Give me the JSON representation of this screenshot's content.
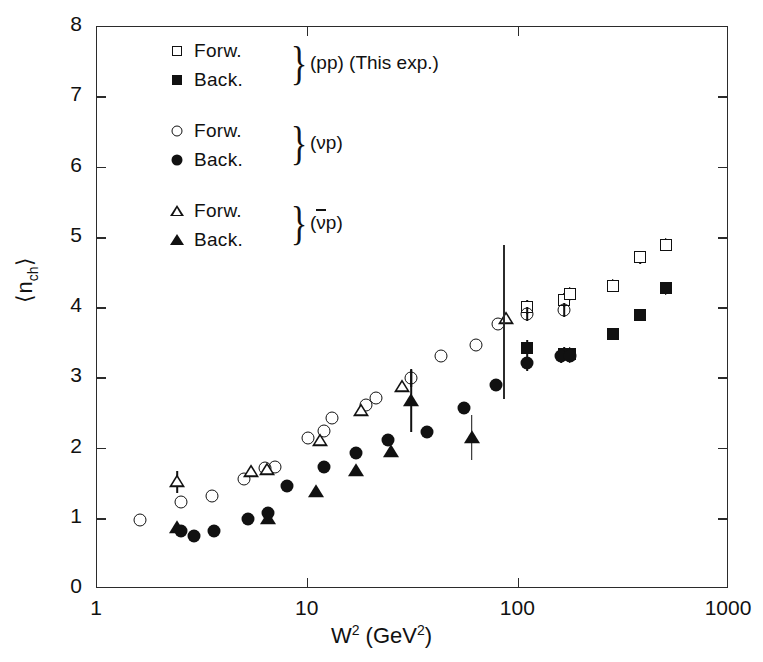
{
  "figure": {
    "background": "#ffffff",
    "ink_color": "#111111"
  },
  "axes": {
    "x": {
      "label_text": "W",
      "label_sup": "2",
      "label_unit": "(GeV",
      "label_unit_sup": "2",
      "label_unit_close": ")",
      "label_full": "W2 (GeV2)",
      "scale": "log",
      "min": 1,
      "max": 1000,
      "ticks": [
        {
          "value": 1,
          "label": "1"
        },
        {
          "value": 10,
          "label": "10"
        },
        {
          "value": 100,
          "label": "100"
        },
        {
          "value": 1000,
          "label": "1000"
        }
      ]
    },
    "y": {
      "label_prefix": "⟨n",
      "label_sub": "ch",
      "label_suffix": "⟩",
      "label_full": "⟨n_ch⟩",
      "scale": "linear",
      "min": 0,
      "max": 8,
      "ticks": [
        {
          "value": 0,
          "label": "0"
        },
        {
          "value": 1,
          "label": "1"
        },
        {
          "value": 2,
          "label": "2"
        },
        {
          "value": 3,
          "label": "3"
        },
        {
          "value": 4,
          "label": "4"
        },
        {
          "value": 5,
          "label": "5"
        },
        {
          "value": 6,
          "label": "6"
        },
        {
          "value": 7,
          "label": "7"
        },
        {
          "value": 8,
          "label": "8"
        }
      ]
    }
  },
  "legend": {
    "groups": [
      {
        "tag": "(pp) (This exp.)",
        "rows": [
          {
            "marker": "open-square",
            "label": "Forw."
          },
          {
            "marker": "filled-square",
            "label": "Back."
          }
        ]
      },
      {
        "tag": "(νp)",
        "rows": [
          {
            "marker": "open-circle",
            "label": "Forw."
          },
          {
            "marker": "filled-circle",
            "label": "Back."
          }
        ]
      },
      {
        "tag": "(νp)",
        "tag_overline": true,
        "rows": [
          {
            "marker": "open-triangle",
            "label": "Forw."
          },
          {
            "marker": "filled-triangle",
            "label": "Back."
          }
        ]
      }
    ],
    "brace_glyph": "}"
  },
  "annotations": {
    "divider_line": {
      "x_value": 85,
      "y_from": 2.7,
      "y_to": 4.9
    }
  },
  "chart_data": {
    "type": "scatter",
    "title": "",
    "xlabel": "W² (GeV²)",
    "ylabel": "⟨n_ch⟩",
    "xscale": "log",
    "xlim": [
      1,
      1000
    ],
    "ylim": [
      0,
      8
    ],
    "grid": false,
    "legend_position": "top-left inside",
    "series": [
      {
        "name": "pp Forw. (This exp.)",
        "marker": "open-square",
        "points": [
          {
            "x": 110,
            "y": 4.02,
            "yerr": 0.1
          },
          {
            "x": 165,
            "y": 4.12,
            "yerr": 0.1
          },
          {
            "x": 175,
            "y": 4.2,
            "yerr": 0.1
          },
          {
            "x": 280,
            "y": 4.32,
            "yerr": 0.09
          },
          {
            "x": 380,
            "y": 4.72,
            "yerr": 0.09
          },
          {
            "x": 500,
            "y": 4.9,
            "yerr": 0.09
          }
        ]
      },
      {
        "name": "pp Back. (This exp.)",
        "marker": "filled-square",
        "points": [
          {
            "x": 110,
            "y": 3.43,
            "yerr": 0.12
          },
          {
            "x": 165,
            "y": 3.35,
            "yerr": 0.1
          },
          {
            "x": 175,
            "y": 3.35,
            "yerr": 0.1
          },
          {
            "x": 280,
            "y": 3.63,
            "yerr": 0.09
          },
          {
            "x": 380,
            "y": 3.9,
            "yerr": 0.09
          },
          {
            "x": 500,
            "y": 4.28,
            "yerr": 0.09
          }
        ]
      },
      {
        "name": "νp Forw.",
        "marker": "open-circle",
        "points": [
          {
            "x": 1.6,
            "y": 0.98,
            "yerr": 0
          },
          {
            "x": 2.5,
            "y": 1.24,
            "yerr": 0
          },
          {
            "x": 3.5,
            "y": 1.33,
            "yerr": 0
          },
          {
            "x": 5.0,
            "y": 1.57,
            "yerr": 0
          },
          {
            "x": 6.3,
            "y": 1.72,
            "yerr": 0
          },
          {
            "x": 7.0,
            "y": 1.73,
            "yerr": 0
          },
          {
            "x": 10.0,
            "y": 2.15,
            "yerr": 0
          },
          {
            "x": 12.0,
            "y": 2.25,
            "yerr": 0
          },
          {
            "x": 13.0,
            "y": 2.43,
            "yerr": 0
          },
          {
            "x": 19.0,
            "y": 2.62,
            "yerr": 0
          },
          {
            "x": 21.0,
            "y": 2.72,
            "yerr": 0
          },
          {
            "x": 31.0,
            "y": 3.0,
            "yerr": 0.12
          },
          {
            "x": 43.0,
            "y": 3.32,
            "yerr": 0
          },
          {
            "x": 63.0,
            "y": 3.47,
            "yerr": 0
          },
          {
            "x": 80.0,
            "y": 3.77,
            "yerr": 0
          },
          {
            "x": 110.0,
            "y": 3.92,
            "yerr": 0.1
          },
          {
            "x": 165.0,
            "y": 3.97,
            "yerr": 0.1
          }
        ]
      },
      {
        "name": "νp Back.",
        "marker": "filled-circle",
        "points": [
          {
            "x": 2.5,
            "y": 0.82,
            "yerr": 0
          },
          {
            "x": 2.9,
            "y": 0.76,
            "yerr": 0
          },
          {
            "x": 3.6,
            "y": 0.83,
            "yerr": 0
          },
          {
            "x": 5.2,
            "y": 0.99,
            "yerr": 0
          },
          {
            "x": 6.5,
            "y": 1.08,
            "yerr": 0
          },
          {
            "x": 8.0,
            "y": 1.47,
            "yerr": 0
          },
          {
            "x": 12.0,
            "y": 1.74,
            "yerr": 0
          },
          {
            "x": 17.0,
            "y": 1.93,
            "yerr": 0
          },
          {
            "x": 24.0,
            "y": 2.12,
            "yerr": 0
          },
          {
            "x": 37.0,
            "y": 2.23,
            "yerr": 0
          },
          {
            "x": 55.0,
            "y": 2.57,
            "yerr": 0
          },
          {
            "x": 78.0,
            "y": 2.9,
            "yerr": 0
          },
          {
            "x": 110.0,
            "y": 3.21,
            "yerr": 0.1
          },
          {
            "x": 160.0,
            "y": 3.32,
            "yerr": 0.1
          },
          {
            "x": 175.0,
            "y": 3.32,
            "yerr": 0.1
          }
        ]
      },
      {
        "name": "ν̄p Forw.",
        "marker": "open-triangle",
        "points": [
          {
            "x": 2.4,
            "y": 1.52,
            "yerr": 0.16
          },
          {
            "x": 5.4,
            "y": 1.67,
            "yerr": 0
          },
          {
            "x": 6.4,
            "y": 1.7,
            "yerr": 0
          },
          {
            "x": 11.5,
            "y": 2.1,
            "yerr": 0
          },
          {
            "x": 18.0,
            "y": 2.53,
            "yerr": 0
          },
          {
            "x": 28.0,
            "y": 2.88,
            "yerr": 0
          },
          {
            "x": 87.0,
            "y": 3.85,
            "yerr": 0
          }
        ]
      },
      {
        "name": "ν̄p Back.",
        "marker": "filled-triangle",
        "points": [
          {
            "x": 2.4,
            "y": 0.87,
            "yerr": 0
          },
          {
            "x": 6.5,
            "y": 1.0,
            "yerr": 0
          },
          {
            "x": 11.0,
            "y": 1.38,
            "yerr": 0
          },
          {
            "x": 17.0,
            "y": 1.68,
            "yerr": 0
          },
          {
            "x": 25.0,
            "y": 1.95,
            "yerr": 0
          },
          {
            "x": 31.0,
            "y": 2.68,
            "yerr": 0.45
          },
          {
            "x": 60.0,
            "y": 2.15,
            "yerr": 0.32
          }
        ]
      }
    ]
  }
}
